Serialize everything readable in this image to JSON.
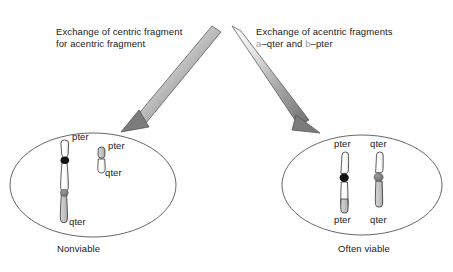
{
  "figure": {
    "background_color": "#ffffff"
  },
  "panels": [
    {
      "id": "left",
      "caption": "Exchange of centric fragment\nfor acentric fragment",
      "outcome": "Nonviable",
      "arrow": {
        "direction": "down-left",
        "name": "arrow-to-nonviable-cell"
      },
      "cell": {
        "name": "nonviable-cell",
        "shape": "ellipse"
      },
      "chromosomes": [
        {
          "name": "large-derivative-chromosome",
          "centromere_color": "#1a1a1a",
          "secondary_centromere_color": "#808080",
          "labels": [
            {
              "text": "pter",
              "position": "top"
            },
            {
              "text": "qter",
              "position": "bottom"
            }
          ]
        },
        {
          "name": "small-acentric-fragment",
          "centromere_color": "none",
          "labels": [
            {
              "text": "pter",
              "position": "top"
            },
            {
              "text": "qter",
              "position": "bottom"
            }
          ]
        }
      ]
    },
    {
      "id": "right",
      "caption_prefix": "Exchange of acentric fragments",
      "caption_frag_a": "a",
      "caption_mid": "–qter and ",
      "caption_frag_b": "b",
      "caption_suffix": "–pter",
      "outcome": "Often viable",
      "arrow": {
        "direction": "down-right",
        "name": "arrow-to-viable-cell"
      },
      "cell": {
        "name": "often-viable-cell",
        "shape": "ellipse"
      },
      "chromosomes": [
        {
          "name": "chromosome-a-derivative",
          "centromere_color": "#1a1a1a",
          "labels": [
            {
              "text": "pter",
              "position": "top"
            },
            {
              "text": "pter",
              "position": "bottom"
            }
          ]
        },
        {
          "name": "chromosome-b-derivative",
          "centromere_color": "#707070",
          "labels": [
            {
              "text": "qter",
              "position": "top"
            },
            {
              "text": "qter",
              "position": "bottom"
            }
          ]
        }
      ]
    }
  ],
  "labels": {
    "left_large_pter": "pter",
    "left_large_qter": "qter",
    "left_small_pter": "pter",
    "left_small_qter": "qter",
    "right_a_pter_top": "pter",
    "right_a_pter_bottom": "pter",
    "right_b_qter_top": "qter",
    "right_b_qter_bottom": "qter"
  },
  "colors": {
    "outline": "#2b2b2b",
    "cell_outline": "#555555",
    "centromere_dark": "#1a1a1a",
    "centromere_gray": "#707070",
    "arm_gray": "#bfbfbf",
    "arm_white": "#ffffff",
    "arrow_dark": "#6e6e6e",
    "arrow_light": "#fdfdfd",
    "text": "#1a1a1a",
    "fragment_label_gray": "#9a9a9a"
  }
}
